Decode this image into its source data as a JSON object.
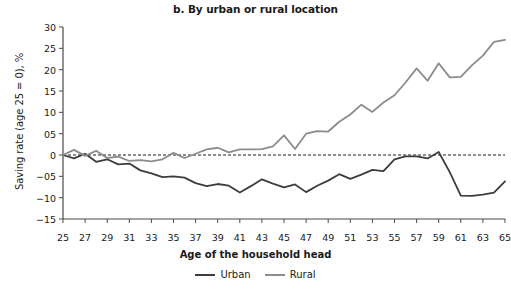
{
  "chart_data": {
    "type": "line",
    "title": "b. By urban or rural location",
    "xlabel": "Age of the household head",
    "ylabel": "Saving rate (age 25 = 0), %",
    "xlim": [
      25,
      65
    ],
    "ylim": [
      -15,
      30
    ],
    "grid": false,
    "zero_reference_line": true,
    "legend_position": "bottom-center",
    "xtick_labels": [
      "25",
      "27",
      "29",
      "31",
      "33",
      "35",
      "37",
      "39",
      "41",
      "43",
      "45",
      "47",
      "49",
      "51",
      "53",
      "55",
      "57",
      "59",
      "61",
      "63",
      "65"
    ],
    "ytick_labels": [
      "30",
      "25",
      "20",
      "15",
      "10",
      "05",
      "0",
      "-05",
      "-10",
      "-15"
    ],
    "ytick_values": [
      30,
      25,
      20,
      15,
      10,
      5,
      0,
      -5,
      -10,
      -15
    ],
    "x": [
      25,
      26,
      27,
      28,
      29,
      30,
      31,
      32,
      33,
      34,
      35,
      36,
      37,
      38,
      39,
      40,
      41,
      42,
      43,
      44,
      45,
      46,
      47,
      48,
      49,
      50,
      51,
      52,
      53,
      54,
      55,
      56,
      57,
      58,
      59,
      60,
      61,
      62,
      63,
      64,
      65
    ],
    "series": [
      {
        "name": "Urban",
        "color": "#3d3d3d",
        "values": [
          0.0,
          -0.8,
          0.3,
          -1.6,
          -1.0,
          -2.2,
          -2.0,
          -3.6,
          -4.3,
          -5.2,
          -5.0,
          -5.3,
          -6.6,
          -7.3,
          -6.8,
          -7.2,
          -8.8,
          -7.3,
          -5.7,
          -6.7,
          -7.6,
          -6.9,
          -8.7,
          -7.2,
          -6.0,
          -4.5,
          -5.6,
          -4.6,
          -3.5,
          -3.8,
          -1.0,
          -0.3,
          -0.3,
          -0.8,
          0.7,
          -4.0,
          -9.5,
          -9.6,
          -9.3,
          -8.8,
          -6.2
        ]
      },
      {
        "name": "Rural",
        "color": "#8c8c8c",
        "values": [
          0.0,
          1.2,
          -0.2,
          1.0,
          -0.7,
          -0.4,
          -1.4,
          -1.2,
          -1.5,
          -1.0,
          0.5,
          -0.7,
          0.3,
          1.3,
          1.7,
          0.6,
          1.3,
          1.3,
          1.4,
          2.0,
          4.6,
          1.4,
          5.0,
          5.6,
          5.5,
          7.8,
          9.5,
          11.8,
          10.1,
          12.3,
          14.0,
          17.0,
          20.3,
          17.4,
          21.5,
          18.2,
          18.3,
          21.0,
          23.3,
          26.5,
          27.0
        ]
      }
    ]
  },
  "legend": {
    "entries": [
      {
        "label": "Urban",
        "color": "#3d3d3d"
      },
      {
        "label": "Rural",
        "color": "#8c8c8c"
      }
    ]
  }
}
